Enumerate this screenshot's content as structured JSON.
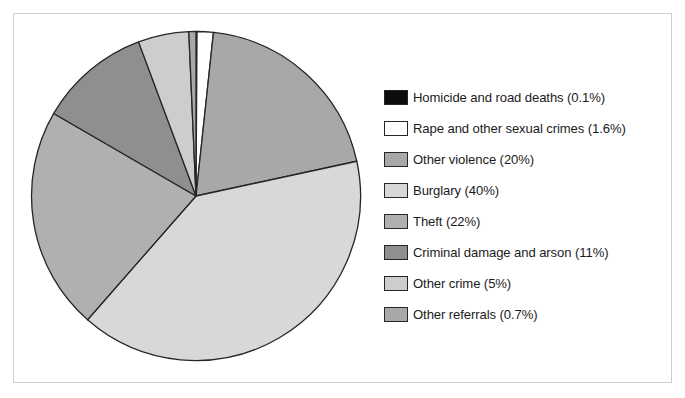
{
  "chart_data": {
    "type": "pie",
    "title": "",
    "subtitle": "",
    "xlabel": "",
    "ylabel": "",
    "legend_position": "right",
    "grid": false,
    "start_angle_deg": 0,
    "direction": "clockwise",
    "categories": [
      "Homicide and road deaths",
      "Rape and other sexual crimes",
      "Other violence",
      "Burglary",
      "Theft",
      "Criminal damage and arson",
      "Other crime",
      "Other referrals"
    ],
    "values": [
      0.1,
      1.6,
      20,
      40,
      22,
      11,
      5,
      0.7
    ],
    "value_unit": "%",
    "colors": [
      "#0d0d0d",
      "#ffffff",
      "#a8a8a8",
      "#d8d8d8",
      "#b0b0b0",
      "#8f8f8f",
      "#cdcdcd",
      "#a8a8a8"
    ],
    "slices": [
      {
        "label": "Homicide and road deaths",
        "value": 0.1,
        "display": "0.1%",
        "color": "#0d0d0d"
      },
      {
        "label": "Rape and other sexual crimes",
        "value": 1.6,
        "display": "1.6%",
        "color": "#ffffff"
      },
      {
        "label": "Other violence",
        "value": 20,
        "display": "20%",
        "color": "#a8a8a8"
      },
      {
        "label": "Burglary",
        "value": 40,
        "display": "40%",
        "color": "#d8d8d8"
      },
      {
        "label": "Theft",
        "value": 22,
        "display": "22%",
        "color": "#b0b0b0"
      },
      {
        "label": "Criminal damage and arson",
        "value": 11,
        "display": "11%",
        "color": "#8f8f8f"
      },
      {
        "label": "Other crime",
        "value": 5,
        "display": "5%",
        "color": "#cdcdcd"
      },
      {
        "label": "Other referrals",
        "value": 0.7,
        "display": "0.7%",
        "color": "#a8a8a8"
      }
    ]
  },
  "legend": {
    "items": [
      {
        "label": "Homicide and road deaths (0.1%)",
        "color": "#0d0d0d",
        "swatch_name": "legend-swatch-homicide-and-road-deaths"
      },
      {
        "label": "Rape and other sexual crimes (1.6%)",
        "color": "#ffffff",
        "swatch_name": "legend-swatch-rape-and-other-sexual-crimes"
      },
      {
        "label": "Other violence (20%)",
        "color": "#a8a8a8",
        "swatch_name": "legend-swatch-other-violence"
      },
      {
        "label": "Burglary (40%)",
        "color": "#d8d8d8",
        "swatch_name": "legend-swatch-burglary"
      },
      {
        "label": "Theft (22%)",
        "color": "#b0b0b0",
        "swatch_name": "legend-swatch-theft"
      },
      {
        "label": "Criminal damage and arson (11%)",
        "color": "#8f8f8f",
        "swatch_name": "legend-swatch-criminal-damage-and-arson"
      },
      {
        "label": "Other crime (5%)",
        "color": "#cdcdcd",
        "swatch_name": "legend-swatch-other-crime"
      },
      {
        "label": "Other referrals (0.7%)",
        "color": "#a8a8a8",
        "swatch_name": "legend-swatch-other-referrals"
      }
    ]
  },
  "style": {
    "background": "#ffffff",
    "frame_color": "#cfcfcf",
    "slice_outline": "#262626",
    "text_color": "#1b1b1b"
  }
}
